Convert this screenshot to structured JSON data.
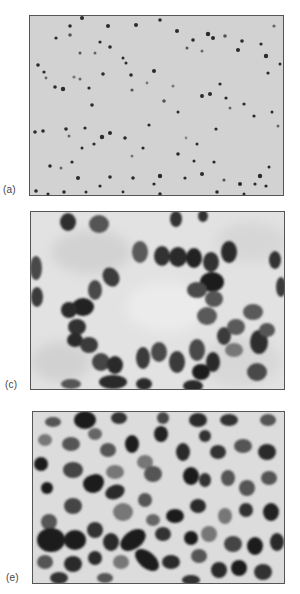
{
  "figure": {
    "panels": [
      {
        "id": "a",
        "label": "(a)",
        "description": "low-magnification micrograph, sparse scattered small dark nuclei on pale background"
      },
      {
        "id": "c",
        "label": "(c)",
        "description": "high-magnification micrograph, ring of oval nuclei surrounding a pale central lumen (rosette)"
      },
      {
        "id": "e",
        "label": "(e)",
        "description": "high-magnification micrograph, densely packed round and oval dark nuclei"
      }
    ],
    "colors": {
      "background_a": "#cfcfcf",
      "background_c": "#e2e2e2",
      "background_e": "#dcdcdc",
      "nucleus_dark": "#1e1e1e",
      "nucleus_mid": "#4a4a4a",
      "nucleus_light": "#7a7a7a",
      "border": "#555555"
    }
  }
}
